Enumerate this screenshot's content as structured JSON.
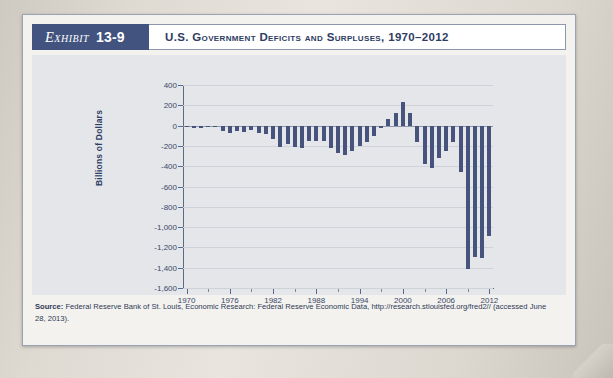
{
  "exhibit": {
    "tag_word": "Exhibit",
    "tag_number": "13-9",
    "title": "U.S. Government Deficits and Surpluses, 1970–2012"
  },
  "source": {
    "label": "Source:",
    "text": " Federal Reserve Bank of St. Louis, Economic Research: Federal Reserve Economic Data, http://research.stlouisfed.org/fred2// (accessed June 28, 2013)."
  },
  "colors": {
    "bar": "#46547d",
    "tag_background": "#41537e",
    "plot_background": "#e4e6ea",
    "panel_background": "#f3f2ef",
    "axis": "#5d6a85",
    "grid": "#ced3da"
  },
  "chart_data": {
    "type": "bar",
    "title": "U.S. Government Deficits and Surpluses, 1970–2012",
    "xlabel": "",
    "ylabel": "Billions of Dollars",
    "ylim": [
      -1600,
      400
    ],
    "ytick_step": 200,
    "yticks": [
      "400",
      "200",
      "0",
      "-200",
      "-400",
      "-600",
      "-800",
      "-1,000",
      "-1,200",
      "-1,400",
      "-1,600"
    ],
    "xticks": [
      "1970",
      "1976",
      "1982",
      "1988",
      "1994",
      "2000",
      "2006",
      "2012"
    ],
    "xtick_step": 6,
    "grid": true,
    "legend": "none",
    "categories": [
      1970,
      1971,
      1972,
      1973,
      1974,
      1975,
      1976,
      1977,
      1978,
      1979,
      1980,
      1981,
      1982,
      1983,
      1984,
      1985,
      1986,
      1987,
      1988,
      1989,
      1990,
      1991,
      1992,
      1993,
      1994,
      1995,
      1996,
      1997,
      1998,
      1999,
      2000,
      2001,
      2002,
      2003,
      2004,
      2005,
      2006,
      2007,
      2008,
      2009,
      2010,
      2011,
      2012
    ],
    "values": [
      -3,
      -23,
      -23,
      -15,
      -6,
      -53,
      -74,
      -54,
      -59,
      -41,
      -74,
      -79,
      -128,
      -208,
      -185,
      -212,
      -221,
      -150,
      -155,
      -153,
      -221,
      -269,
      -290,
      -255,
      -203,
      -164,
      -107,
      -22,
      69,
      126,
      236,
      128,
      -158,
      -378,
      -413,
      -318,
      -248,
      -161,
      -459,
      -1413,
      -1294,
      -1300,
      -1087
    ],
    "annotations": []
  }
}
